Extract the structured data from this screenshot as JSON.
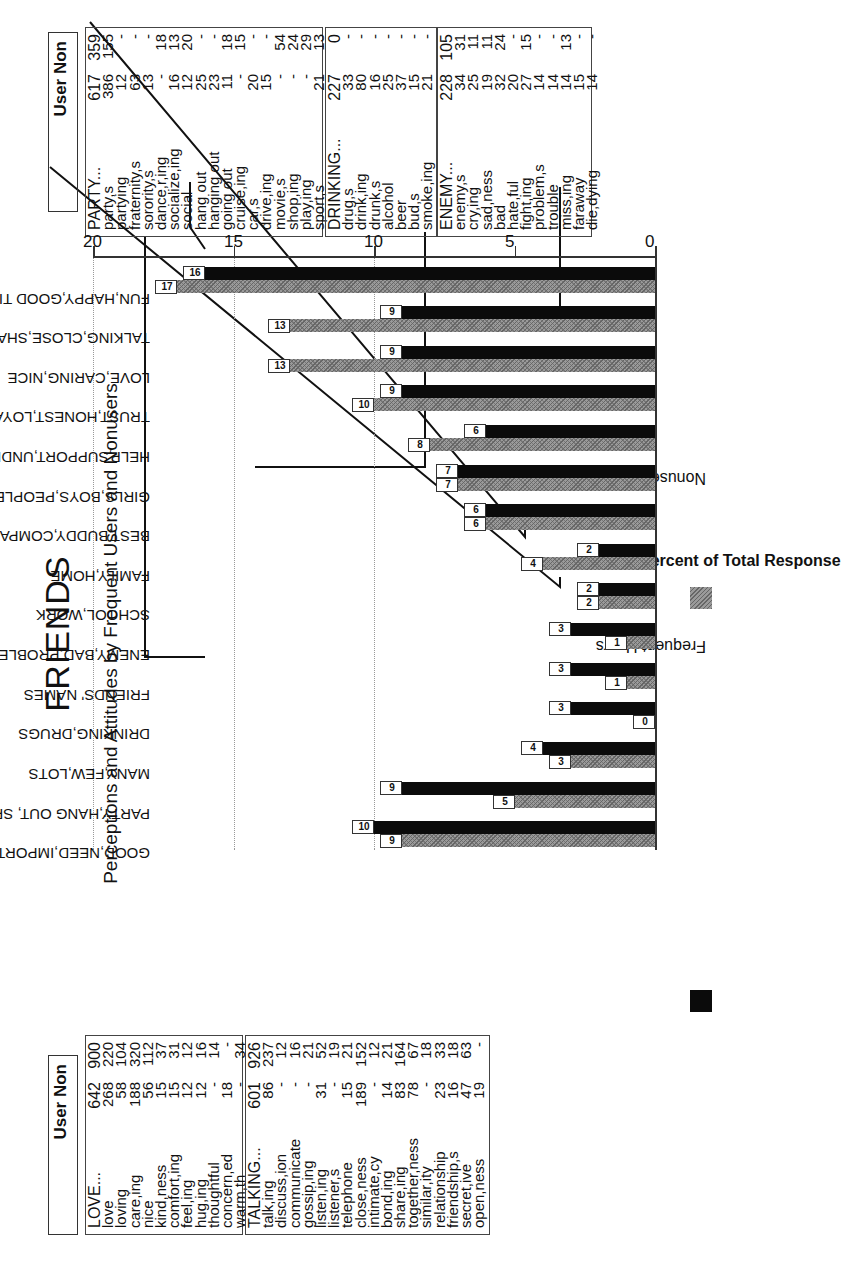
{
  "title": "FRIENDS",
  "subtitle": "Perceptions and Attitudes by Frequent Users and Nonusers",
  "chart_data": {
    "type": "bar",
    "title": "FRIENDS",
    "subtitle": "Perceptions and Attitudes by Frequent Users and Nonusers",
    "xlabel": "",
    "ylabel": "Percent of Total Response",
    "ylim": [
      0,
      20
    ],
    "yticks": [
      0,
      5,
      10,
      15,
      20
    ],
    "grid": "dotted at 10 and 15 and 20",
    "legend_position": "bottom",
    "categories": [
      "GOOD,NEED,IMPORTANT",
      "PARTY,HANG OUT, SPORTS",
      "MANY,FEW,LOTS",
      "DRINKING,DRUGS",
      "FRIENDS' NAMES",
      "ENEMY,BAD,PROBLEMS",
      "SCHOOL,WORK",
      "FAMILY,HOME",
      "BEST,BUDDY,COMPANION",
      "GIRLS,BOYS,PEOPLE",
      "HELP,SUPPORT,UNDERSTAND",
      "TRUST,HONEST,LOYAL",
      "LOVE,CARING,NICE",
      "TALKING,CLOSE,SHARING",
      "FUN,HAPPY,GOOD TIMES"
    ],
    "series": [
      {
        "name": "Frequent Users",
        "color": "#0b0b0b",
        "values": [
          10,
          9,
          4,
          3,
          3,
          3,
          2,
          2,
          6,
          7,
          6,
          9,
          9,
          9,
          16
        ]
      },
      {
        "name": "Nonusers",
        "color": "#9a9a9a",
        "values": [
          9,
          5,
          3,
          0,
          1,
          1,
          2,
          4,
          6,
          7,
          8,
          10,
          13,
          13,
          17
        ]
      }
    ]
  },
  "legend": {
    "users_label": "Frequent Users",
    "nonusers_label": "Nonusers"
  },
  "axis": {
    "title": "Percent of Total Response",
    "ticks": [
      "0",
      "5",
      "10",
      "15",
      "20"
    ]
  },
  "tables": {
    "left_header": "User Non",
    "right_header": "User Non",
    "party": {
      "rows": [
        [
          "PARTY...",
          "617",
          "359"
        ],
        [
          "party,s",
          "386",
          "155"
        ],
        [
          "partying",
          "12",
          "-"
        ],
        [
          "fraternity,s",
          "63",
          "-"
        ],
        [
          "sorority,s",
          "13",
          "-"
        ],
        [
          "dance,r,ing",
          "-",
          "18"
        ],
        [
          "socialize,ing",
          "16",
          "13"
        ],
        [
          "social",
          "12",
          "20"
        ],
        [
          "hang out",
          "25",
          "-"
        ],
        [
          "hanging out",
          "23",
          "-"
        ],
        [
          "going out",
          "11",
          "18"
        ],
        [
          "cruise,ing",
          "-",
          "15"
        ],
        [
          "car,s",
          "20",
          "-"
        ],
        [
          "drive,ing",
          "15",
          "-"
        ],
        [
          "movie,s",
          "-",
          "54"
        ],
        [
          "shop,ing",
          "-",
          "24"
        ],
        [
          "play,ing",
          "-",
          "29"
        ],
        [
          "sport,s",
          "21",
          "13"
        ]
      ]
    },
    "drinking": {
      "rows": [
        [
          "DRINKING...",
          "227",
          "0"
        ],
        [
          "drug,s",
          "33",
          "-"
        ],
        [
          "drink,ing",
          "80",
          "-"
        ],
        [
          "drunk,s",
          "16",
          "-"
        ],
        [
          "alcohol",
          "25",
          "-"
        ],
        [
          "beer",
          "37",
          "-"
        ],
        [
          "bud,s",
          "15",
          "-"
        ],
        [
          "smoke,ing",
          "21",
          "-"
        ]
      ]
    },
    "enemy": {
      "rows": [
        [
          "ENEMY...",
          "228",
          "105"
        ],
        [
          "enemy,s",
          "34",
          "31"
        ],
        [
          "cry,ing",
          "25",
          "11"
        ],
        [
          "sad,ness",
          "19",
          "11"
        ],
        [
          "bad",
          "32",
          "24"
        ],
        [
          "hate,ful",
          "20",
          "-"
        ],
        [
          "fight,ing",
          "27",
          "15"
        ],
        [
          "problem,s",
          "14",
          "-"
        ],
        [
          "trouble",
          "14",
          "-"
        ],
        [
          "miss,ing",
          "14",
          "13"
        ],
        [
          "faraway",
          "15",
          "-"
        ],
        [
          "die,dying",
          "14",
          "-"
        ]
      ]
    },
    "love": {
      "rows": [
        [
          "LOVE...",
          "642",
          "900"
        ],
        [
          "love",
          "268",
          "220"
        ],
        [
          "loving",
          "58",
          "104"
        ],
        [
          "care,ing",
          "188",
          "320"
        ],
        [
          "nice",
          "56",
          "112"
        ],
        [
          "kind,ness",
          "15",
          "37"
        ],
        [
          "comfort,ing",
          "15",
          "31"
        ],
        [
          "feel,ing",
          "12",
          "12"
        ],
        [
          "hug,ing",
          "12",
          "16"
        ],
        [
          "thoughtful",
          "-",
          "14"
        ],
        [
          "concern,ed",
          "18",
          "-"
        ],
        [
          "warm,th",
          "-",
          "34"
        ]
      ]
    },
    "talking": {
      "rows": [
        [
          "TALKING...",
          "601",
          "926"
        ],
        [
          "talk,ing",
          "86",
          "237"
        ],
        [
          "discuss,ion",
          "-",
          "12"
        ],
        [
          "communicate",
          "-",
          "16"
        ],
        [
          "gossip,ing",
          "-",
          "21"
        ],
        [
          "listen,ing",
          "31",
          "52"
        ],
        [
          "listener,s",
          "-",
          "19"
        ],
        [
          "telephone",
          "15",
          "21"
        ],
        [
          "close,ness",
          "189",
          "152"
        ],
        [
          "intimate,cy",
          "-",
          "12"
        ],
        [
          "bond,ing",
          "14",
          "21"
        ],
        [
          "share,ing",
          "83",
          "164"
        ],
        [
          "together,ness",
          "78",
          "67"
        ],
        [
          "similar,ity",
          "-",
          "18"
        ],
        [
          "relationship",
          "23",
          "33"
        ],
        [
          "friendship,s",
          "16",
          "18"
        ],
        [
          "secret,ive",
          "47",
          "63"
        ],
        [
          "open,ness",
          "19",
          "-"
        ]
      ]
    }
  }
}
